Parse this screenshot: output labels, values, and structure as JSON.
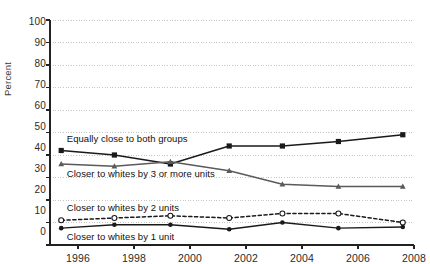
{
  "chart_data": {
    "type": "line",
    "title": "",
    "subtitle": "",
    "xlabel": "",
    "ylabel": "Percent",
    "xlim": [
      1995,
      2008
    ],
    "ylim": [
      0,
      100
    ],
    "yticks": [
      0,
      10,
      20,
      30,
      40,
      50,
      60,
      70,
      80,
      90,
      100
    ],
    "xticks": [
      1996,
      1998,
      2000,
      2002,
      2004,
      2006,
      2008
    ],
    "grid": true,
    "legend_position": "inline-annotations",
    "x": [
      1995.4,
      1997.3,
      1999.3,
      2001.4,
      2003.3,
      2005.3,
      2007.6
    ],
    "series": [
      {
        "name": "Equally close to both groups",
        "marker": "filled-square",
        "linestyle": "solid",
        "color": "#1a1a1a",
        "values": [
          42,
          40,
          36,
          44,
          44,
          46,
          49
        ]
      },
      {
        "name": "Closer to whites by 3 or more units",
        "marker": "filled-triangle",
        "linestyle": "solid",
        "color": "#5a5a5a",
        "values": [
          36,
          35,
          37,
          33,
          27,
          26,
          26
        ]
      },
      {
        "name": "Closer to whites by 2 units",
        "marker": "open-circle",
        "linestyle": "dashed",
        "color": "#1a1a1a",
        "values": [
          11,
          12,
          13,
          12,
          14,
          14,
          10
        ]
      },
      {
        "name": "Closer to whites by 1 unit",
        "marker": "filled-circle",
        "linestyle": "solid",
        "color": "#1a1a1a",
        "values": [
          7.5,
          9,
          9,
          7,
          10,
          7.5,
          8
        ]
      }
    ],
    "annotations": [
      {
        "text": "Equally close to both groups",
        "x": 1995.6,
        "y": 47
      },
      {
        "text": "Closer to whites by 3 or more units",
        "x": 1995.6,
        "y": 31.5
      },
      {
        "text": "Closer to whites by 2 units",
        "x": 1995.6,
        "y": 16.5
      },
      {
        "text": "Closer to whites by 1 unit",
        "x": 1995.6,
        "y": 3.5
      }
    ]
  },
  "axis": {
    "y_title": "Percent",
    "y_tick_labels": [
      "100",
      "90",
      "80",
      "70",
      "60",
      "50",
      "40",
      "30",
      "20",
      "10",
      "0"
    ],
    "x_tick_labels": [
      "1996",
      "1998",
      "2000",
      "2002",
      "2004",
      "2006",
      "2008"
    ]
  },
  "colors": {
    "axis": "#222222",
    "grid": "#b8b8b8",
    "series_dark": "#1a1a1a",
    "series_gray": "#5a5a5a",
    "background": "#ffffff"
  }
}
